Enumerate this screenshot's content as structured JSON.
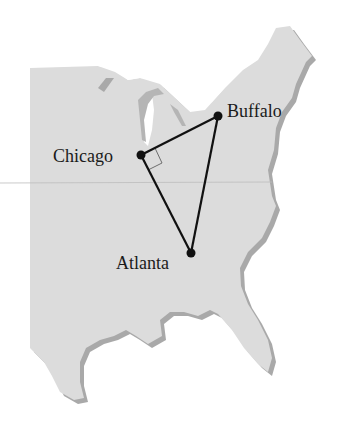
{
  "diagram": {
    "type": "map-triangle",
    "region": "Eastern United States",
    "colors": {
      "land": "#dcdcdc",
      "shadow": "#a9a9a9",
      "lines": "#111111",
      "label": "#1a1a1a",
      "right_angle_marker": "#6e6e6e"
    },
    "cities": [
      {
        "name": "Chicago",
        "x": 141,
        "y": 155
      },
      {
        "name": "Buffalo",
        "x": 218,
        "y": 116
      },
      {
        "name": "Atlanta",
        "x": 191,
        "y": 253
      }
    ],
    "edges": [
      [
        "Chicago",
        "Buffalo"
      ],
      [
        "Buffalo",
        "Atlanta"
      ],
      [
        "Atlanta",
        "Chicago"
      ]
    ],
    "right_angle_at": "Chicago"
  },
  "labels": {
    "chicago": "Chicago",
    "buffalo": "Buffalo",
    "atlanta": "Atlanta"
  }
}
